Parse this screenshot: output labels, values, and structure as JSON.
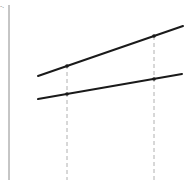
{
  "figure": {
    "axis_label": "-.",
    "colors": {
      "line": "#1a1a1a",
      "axis": "#8c8c8c",
      "guide": "#b0b0b0"
    },
    "y_axis": {
      "x": 9,
      "y1": 5,
      "y2": 180
    },
    "lines": [
      {
        "name": "upper-line",
        "x1": 38,
        "y1": 76,
        "x2": 183,
        "y2": 26
      },
      {
        "name": "lower-line",
        "x1": 38,
        "y1": 99,
        "x2": 182,
        "y2": 74
      }
    ],
    "guides": [
      {
        "name": "left-guide",
        "x": 67,
        "y1": 65,
        "y2": 180
      },
      {
        "name": "right-guide",
        "x": 154,
        "y1": 36,
        "y2": 180
      }
    ],
    "points": [
      {
        "name": "upper-left-point",
        "x": 67,
        "y": 66
      },
      {
        "name": "upper-right-point",
        "x": 154,
        "y": 36
      },
      {
        "name": "lower-left-point",
        "x": 67,
        "y": 94
      },
      {
        "name": "lower-right-point",
        "x": 154,
        "y": 79
      }
    ]
  }
}
